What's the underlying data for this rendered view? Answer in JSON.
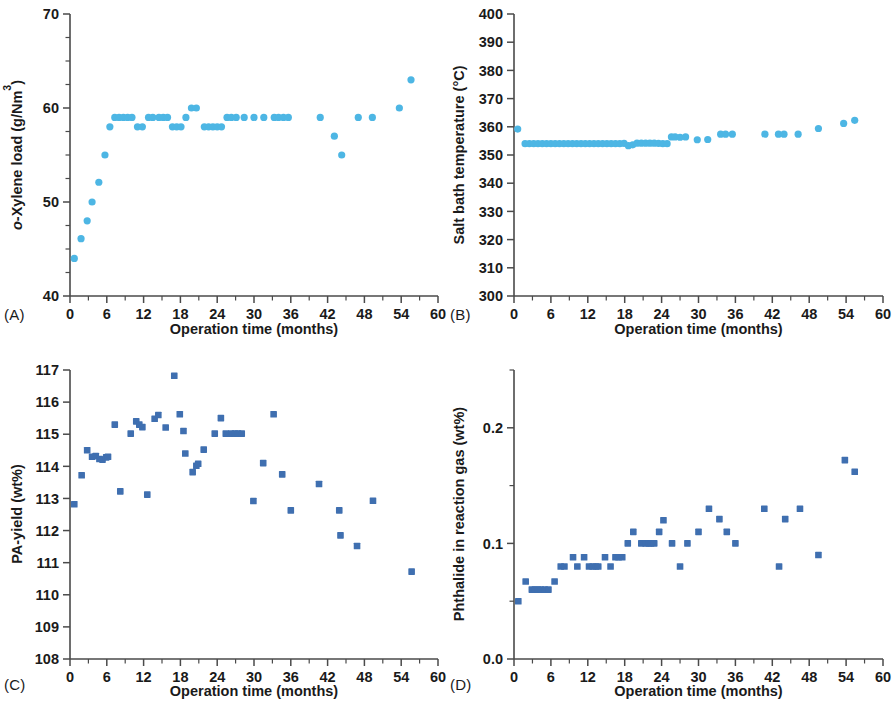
{
  "figure": {
    "background": "#ffffff",
    "shared_xlabel": "Operation time (months)",
    "marker_color_light": "#4db6e4",
    "marker_color_dark": "#3f6fb0"
  },
  "panels": [
    {
      "tag": "(A)",
      "name": "panel-a"
    },
    {
      "tag": "(B)",
      "name": "panel-b"
    },
    {
      "tag": "(C)",
      "name": "panel-c"
    },
    {
      "tag": "(D)",
      "name": "panel-d"
    }
  ],
  "chart_data": [
    {
      "id": "A",
      "type": "scatter",
      "panel_label": "(A)",
      "title": "",
      "xlabel": "Operation time (months)",
      "ylabel": "o-Xylene load (g/Nm3)",
      "ylabel_parts": {
        "italic": "o",
        "rest": "-Xylene load (g/Nm",
        "sup": "3",
        "tail": ")"
      },
      "xlim": [
        0,
        60
      ],
      "ylim": [
        40,
        70
      ],
      "xticks": [
        0,
        6,
        12,
        18,
        24,
        30,
        36,
        42,
        48,
        54,
        60
      ],
      "yticks": [
        40,
        50,
        60,
        70
      ],
      "y_minor_step": 2.5,
      "x_minor_step": 3,
      "grid": false,
      "legend": null,
      "marker": "circle",
      "color": "#4db6e4",
      "points": [
        [
          0.7,
          44.0
        ],
        [
          1.8,
          46.1
        ],
        [
          2.8,
          48.0
        ],
        [
          3.6,
          50.0
        ],
        [
          4.7,
          52.1
        ],
        [
          5.7,
          55.0
        ],
        [
          6.5,
          58.0
        ],
        [
          7.3,
          59.0
        ],
        [
          8.0,
          59.0
        ],
        [
          8.7,
          59.0
        ],
        [
          9.4,
          59.0
        ],
        [
          10.1,
          59.0
        ],
        [
          11.0,
          58.0
        ],
        [
          11.8,
          58.0
        ],
        [
          12.8,
          59.0
        ],
        [
          13.5,
          59.0
        ],
        [
          14.5,
          59.0
        ],
        [
          15.2,
          59.0
        ],
        [
          15.9,
          59.0
        ],
        [
          16.7,
          58.0
        ],
        [
          17.4,
          58.0
        ],
        [
          18.1,
          58.0
        ],
        [
          18.9,
          59.0
        ],
        [
          19.8,
          60.0
        ],
        [
          20.6,
          60.0
        ],
        [
          21.9,
          58.0
        ],
        [
          22.6,
          58.0
        ],
        [
          23.3,
          58.0
        ],
        [
          24.0,
          58.0
        ],
        [
          24.7,
          58.0
        ],
        [
          25.6,
          59.0
        ],
        [
          26.3,
          59.0
        ],
        [
          27.1,
          59.0
        ],
        [
          28.4,
          59.0
        ],
        [
          30.0,
          59.0
        ],
        [
          31.6,
          59.0
        ],
        [
          33.3,
          59.0
        ],
        [
          34.0,
          59.0
        ],
        [
          34.8,
          59.0
        ],
        [
          35.6,
          59.0
        ],
        [
          40.8,
          59.0
        ],
        [
          43.1,
          57.0
        ],
        [
          44.3,
          55.0
        ],
        [
          47.0,
          59.0
        ],
        [
          49.3,
          59.0
        ],
        [
          53.7,
          60.0
        ],
        [
          55.6,
          63.0
        ]
      ]
    },
    {
      "id": "B",
      "type": "scatter",
      "panel_label": "(B)",
      "title": "",
      "xlabel": "Operation time (months)",
      "ylabel": "Salt bath temperature (°C)",
      "xlim": [
        0,
        60
      ],
      "ylim": [
        300,
        400
      ],
      "xticks": [
        0,
        6,
        12,
        18,
        24,
        30,
        36,
        42,
        48,
        54,
        60
      ],
      "yticks": [
        300,
        310,
        320,
        330,
        340,
        350,
        360,
        370,
        380,
        390,
        400
      ],
      "y_minor_step": 0,
      "x_minor_step": 3,
      "grid": false,
      "legend": null,
      "marker": "circle",
      "color": "#4db6e4",
      "points": [
        [
          0.6,
          359.2
        ],
        [
          1.8,
          354.0
        ],
        [
          2.5,
          354.0
        ],
        [
          3.2,
          354.0
        ],
        [
          3.9,
          354.0
        ],
        [
          4.6,
          354.0
        ],
        [
          5.3,
          354.0
        ],
        [
          6.0,
          354.0
        ],
        [
          6.7,
          354.0
        ],
        [
          7.4,
          354.0
        ],
        [
          8.1,
          354.0
        ],
        [
          8.8,
          354.0
        ],
        [
          9.5,
          354.0
        ],
        [
          10.2,
          354.0
        ],
        [
          10.9,
          354.0
        ],
        [
          11.6,
          354.0
        ],
        [
          12.3,
          354.0
        ],
        [
          13.0,
          354.0
        ],
        [
          13.7,
          354.0
        ],
        [
          14.4,
          354.0
        ],
        [
          15.1,
          354.0
        ],
        [
          15.8,
          354.0
        ],
        [
          16.5,
          354.0
        ],
        [
          17.2,
          354.0
        ],
        [
          17.9,
          354.1
        ],
        [
          18.6,
          353.3
        ],
        [
          19.3,
          353.6
        ],
        [
          20.0,
          354.2
        ],
        [
          20.7,
          354.2
        ],
        [
          21.4,
          354.2
        ],
        [
          22.1,
          354.2
        ],
        [
          22.8,
          354.2
        ],
        [
          23.5,
          354.1
        ],
        [
          24.2,
          354.0
        ],
        [
          24.9,
          354.0
        ],
        [
          25.6,
          356.4
        ],
        [
          26.2,
          356.4
        ],
        [
          27.0,
          356.3
        ],
        [
          27.9,
          356.4
        ],
        [
          29.8,
          355.4
        ],
        [
          31.5,
          355.5
        ],
        [
          33.6,
          357.4
        ],
        [
          34.4,
          357.4
        ],
        [
          35.5,
          357.4
        ],
        [
          40.8,
          357.4
        ],
        [
          43.0,
          357.4
        ],
        [
          43.9,
          357.4
        ],
        [
          46.2,
          357.4
        ],
        [
          49.5,
          359.4
        ],
        [
          53.6,
          361.2
        ],
        [
          55.4,
          362.3
        ]
      ]
    },
    {
      "id": "C",
      "type": "scatter",
      "panel_label": "(C)",
      "title": "",
      "xlabel": "Operation time (months)",
      "ylabel": "PA-yield (wt%)",
      "xlim": [
        0,
        60
      ],
      "ylim": [
        108,
        117
      ],
      "xticks": [
        0,
        6,
        12,
        18,
        24,
        30,
        36,
        42,
        48,
        54,
        60
      ],
      "yticks": [
        108,
        109,
        110,
        111,
        112,
        113,
        114,
        115,
        116,
        117
      ],
      "y_minor_step": 0,
      "x_minor_step": 3,
      "grid": false,
      "legend": null,
      "marker": "square",
      "color": "#3f6fb0",
      "points": [
        [
          0.7,
          112.82
        ],
        [
          1.9,
          113.72
        ],
        [
          2.8,
          114.5
        ],
        [
          3.6,
          114.3
        ],
        [
          4.2,
          114.32
        ],
        [
          4.8,
          114.23
        ],
        [
          5.3,
          114.21
        ],
        [
          5.9,
          114.28
        ],
        [
          6.2,
          114.3
        ],
        [
          7.3,
          115.3
        ],
        [
          8.2,
          113.22
        ],
        [
          9.9,
          115.02
        ],
        [
          10.8,
          115.4
        ],
        [
          11.3,
          115.3
        ],
        [
          11.8,
          115.22
        ],
        [
          12.6,
          113.12
        ],
        [
          13.8,
          115.48
        ],
        [
          14.4,
          115.6
        ],
        [
          15.6,
          115.21
        ],
        [
          17.0,
          116.82
        ],
        [
          17.9,
          115.62
        ],
        [
          18.5,
          115.1
        ],
        [
          18.8,
          114.4
        ],
        [
          20.0,
          113.82
        ],
        [
          20.6,
          114.02
        ],
        [
          20.9,
          114.08
        ],
        [
          21.8,
          114.52
        ],
        [
          23.6,
          115.02
        ],
        [
          24.6,
          115.5
        ],
        [
          25.4,
          115.02
        ],
        [
          26.3,
          115.02
        ],
        [
          26.9,
          115.02
        ],
        [
          27.4,
          115.02
        ],
        [
          28.0,
          115.02
        ],
        [
          29.9,
          112.92
        ],
        [
          31.5,
          114.1
        ],
        [
          33.2,
          115.62
        ],
        [
          34.6,
          113.75
        ],
        [
          36.0,
          112.63
        ],
        [
          40.6,
          113.45
        ],
        [
          43.9,
          112.63
        ],
        [
          44.1,
          111.85
        ],
        [
          46.8,
          111.52
        ],
        [
          49.4,
          112.93
        ],
        [
          55.7,
          110.72
        ]
      ]
    },
    {
      "id": "D",
      "type": "scatter",
      "panel_label": "(D)",
      "title": "",
      "xlabel": "Operation time (months)",
      "ylabel": "Phthalide in reaction gas (wt%)",
      "xlim": [
        0,
        60
      ],
      "ylim": [
        0.0,
        0.25
      ],
      "xticks": [
        0,
        6,
        12,
        18,
        24,
        30,
        36,
        42,
        48,
        54,
        60
      ],
      "yticks": [
        0.0,
        0.1,
        0.2
      ],
      "ytick_labels": [
        "0.0",
        "0.1",
        "0.2"
      ],
      "y_minor_ticks": [
        0.05,
        0.15,
        0.25
      ],
      "x_minor_step": 3,
      "grid": false,
      "legend": null,
      "marker": "square",
      "color": "#3f6fb0",
      "points": [
        [
          0.7,
          0.05
        ],
        [
          1.9,
          0.067
        ],
        [
          2.9,
          0.06
        ],
        [
          3.4,
          0.06
        ],
        [
          3.9,
          0.06
        ],
        [
          4.4,
          0.06
        ],
        [
          5.0,
          0.06
        ],
        [
          5.6,
          0.06
        ],
        [
          6.6,
          0.067
        ],
        [
          7.6,
          0.08
        ],
        [
          8.2,
          0.08
        ],
        [
          9.6,
          0.088
        ],
        [
          10.3,
          0.08
        ],
        [
          11.4,
          0.088
        ],
        [
          12.2,
          0.08
        ],
        [
          12.8,
          0.08
        ],
        [
          13.3,
          0.08
        ],
        [
          13.7,
          0.08
        ],
        [
          14.8,
          0.088
        ],
        [
          15.7,
          0.08
        ],
        [
          16.5,
          0.088
        ],
        [
          17.0,
          0.088
        ],
        [
          17.6,
          0.088
        ],
        [
          18.5,
          0.1
        ],
        [
          19.4,
          0.11
        ],
        [
          20.7,
          0.1
        ],
        [
          21.4,
          0.1
        ],
        [
          21.9,
          0.1
        ],
        [
          22.3,
          0.1
        ],
        [
          22.8,
          0.1
        ],
        [
          23.6,
          0.11
        ],
        [
          24.3,
          0.12
        ],
        [
          25.7,
          0.1
        ],
        [
          27.0,
          0.08
        ],
        [
          28.2,
          0.1
        ],
        [
          30.0,
          0.11
        ],
        [
          31.7,
          0.13
        ],
        [
          33.4,
          0.121
        ],
        [
          34.6,
          0.11
        ],
        [
          36.0,
          0.1
        ],
        [
          40.7,
          0.13
        ],
        [
          43.1,
          0.08
        ],
        [
          44.1,
          0.121
        ],
        [
          46.5,
          0.13
        ],
        [
          49.5,
          0.09
        ],
        [
          53.8,
          0.172
        ],
        [
          55.4,
          0.162
        ]
      ]
    }
  ]
}
